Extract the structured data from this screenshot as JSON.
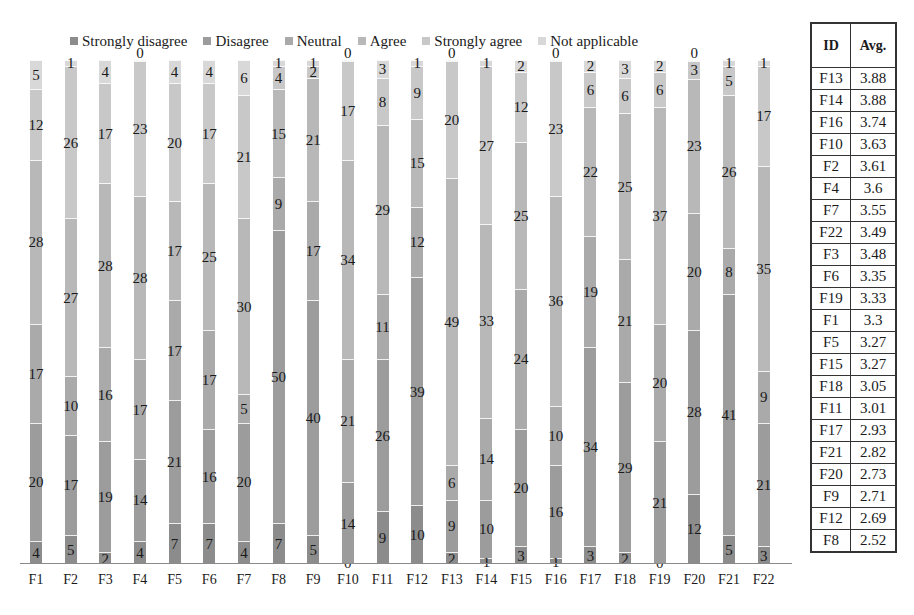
{
  "chart_data": {
    "type": "bar",
    "stacked": true,
    "normalized": true,
    "orientation": "vertical",
    "title": "",
    "xlabel": "",
    "ylabel": "",
    "grid": false,
    "legend_position": "top",
    "categories": [
      "F1",
      "F2",
      "F3",
      "F4",
      "F5",
      "F6",
      "F7",
      "F8",
      "F9",
      "F10",
      "F11",
      "F12",
      "F13",
      "F14",
      "F15",
      "F16",
      "F17",
      "F18",
      "F19",
      "F20",
      "F21",
      "F22"
    ],
    "series": [
      {
        "name": "Strongly disagree",
        "color": "#8c8c8c",
        "values": [
          4,
          5,
          2,
          4,
          7,
          7,
          4,
          7,
          5,
          0,
          9,
          10,
          2,
          1,
          3,
          1,
          3,
          2,
          0,
          12,
          5,
          3
        ]
      },
      {
        "name": "Disagree",
        "color": "#9c9c9c",
        "values": [
          20,
          17,
          19,
          14,
          21,
          16,
          20,
          50,
          40,
          14,
          26,
          39,
          9,
          10,
          20,
          16,
          34,
          29,
          21,
          28,
          41,
          21
        ]
      },
      {
        "name": "Neutral",
        "color": "#aaaaaa",
        "values": [
          17,
          10,
          16,
          17,
          17,
          17,
          5,
          9,
          17,
          21,
          11,
          12,
          6,
          14,
          24,
          10,
          19,
          21,
          20,
          20,
          8,
          9
        ]
      },
      {
        "name": "Agree",
        "color": "#b8b8b8",
        "values": [
          28,
          27,
          28,
          28,
          17,
          25,
          30,
          15,
          21,
          34,
          29,
          15,
          49,
          33,
          25,
          36,
          22,
          25,
          37,
          23,
          26,
          35
        ]
      },
      {
        "name": "Strongly agree",
        "color": "#c8c8c8",
        "values": [
          12,
          26,
          17,
          23,
          20,
          17,
          21,
          4,
          2,
          17,
          8,
          9,
          20,
          27,
          12,
          23,
          6,
          6,
          6,
          3,
          5,
          17
        ]
      },
      {
        "name": "Not applicable",
        "color": "#d8d8d8",
        "values": [
          5,
          1,
          4,
          0,
          4,
          4,
          6,
          1,
          1,
          0,
          3,
          1,
          0,
          1,
          2,
          0,
          2,
          3,
          2,
          0,
          1,
          1
        ]
      }
    ]
  },
  "legend": {
    "items": [
      {
        "label": "Strongly disagree",
        "color": "#8c8c8c"
      },
      {
        "label": "Disagree",
        "color": "#9c9c9c"
      },
      {
        "label": "Neutral",
        "color": "#aaaaaa"
      },
      {
        "label": "Agree",
        "color": "#b8b8b8"
      },
      {
        "label": "Strongly agree",
        "color": "#c8c8c8"
      },
      {
        "label": "Not applicable",
        "color": "#d8d8d8"
      }
    ]
  },
  "avg_table": {
    "headers": {
      "id": "ID",
      "avg": "Avg."
    },
    "rows": [
      {
        "id": "F13",
        "avg": "3.88"
      },
      {
        "id": "F14",
        "avg": "3.88"
      },
      {
        "id": "F16",
        "avg": "3.74"
      },
      {
        "id": "F10",
        "avg": "3.63"
      },
      {
        "id": "F2",
        "avg": "3.61"
      },
      {
        "id": "F4",
        "avg": "3.6"
      },
      {
        "id": "F7",
        "avg": "3.55"
      },
      {
        "id": "F22",
        "avg": "3.49"
      },
      {
        "id": "F3",
        "avg": "3.48"
      },
      {
        "id": "F6",
        "avg": "3.35"
      },
      {
        "id": "F19",
        "avg": "3.33"
      },
      {
        "id": "F1",
        "avg": "3.3"
      },
      {
        "id": "F5",
        "avg": "3.27"
      },
      {
        "id": "F15",
        "avg": "3.27"
      },
      {
        "id": "F18",
        "avg": "3.05"
      },
      {
        "id": "F11",
        "avg": "3.01"
      },
      {
        "id": "F17",
        "avg": "2.93"
      },
      {
        "id": "F21",
        "avg": "2.82"
      },
      {
        "id": "F20",
        "avg": "2.73"
      },
      {
        "id": "F9",
        "avg": "2.71"
      },
      {
        "id": "F12",
        "avg": "2.69"
      },
      {
        "id": "F8",
        "avg": "2.52"
      }
    ]
  }
}
